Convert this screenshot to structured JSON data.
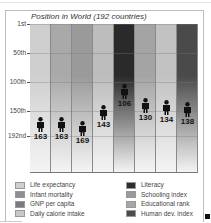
{
  "chart_data": {
    "type": "bar",
    "title": "Position in World (192 countries)",
    "xlabel": "",
    "ylabel": "",
    "ylim": [
      1,
      192
    ],
    "y_inverted": true,
    "y_ticks": [
      "1st",
      "50th",
      "100th",
      "150th",
      "192nd"
    ],
    "y_tick_values": [
      1,
      50,
      100,
      150,
      192
    ],
    "grid": true,
    "legend_position": "bottom",
    "categories": [
      "Life expectancy",
      "Infant mortality",
      "GNP per capita",
      "Daily calorie intake",
      "Literacy",
      "Schooling index",
      "Educational rank",
      "Human dev. index"
    ],
    "values": [
      163,
      163,
      169,
      143,
      106,
      130,
      134,
      138
    ],
    "value_labels": [
      "163",
      "163",
      "169",
      "143",
      "106",
      "130",
      "134",
      "138"
    ],
    "colors": [
      "#cfcfcf",
      "#a9a9a9",
      "#9a9a9a",
      "#bdbdbd",
      "#2a2a2a",
      "#a4a4a4",
      "#c2c2c2",
      "#4a4a4a"
    ]
  },
  "legend": {
    "left": [
      {
        "label": "Life expectancy",
        "color": "#cfcfcf"
      },
      {
        "label": "Infant mortality",
        "color": "#8f8f8f"
      },
      {
        "label": "GNP per capita",
        "color": "#7a7a7a"
      },
      {
        "label": "Daily calorie intake",
        "color": "#c8c8c8"
      }
    ],
    "right": [
      {
        "label": "Literacy",
        "color": "#2e2e2e"
      },
      {
        "label": "Schooling index",
        "color": "#9a9a9a"
      },
      {
        "label": "Educational rank",
        "color": "#a6a6a6"
      },
      {
        "label": "Human dev. index",
        "color": "#4c4c4c"
      }
    ]
  }
}
